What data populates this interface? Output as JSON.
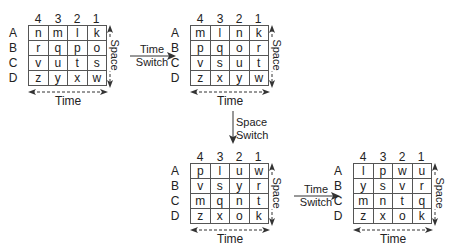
{
  "columns": [
    "4",
    "3",
    "2",
    "1"
  ],
  "rows": [
    "A",
    "B",
    "C",
    "D"
  ],
  "axis_labels": {
    "time": "Time",
    "space": "Space"
  },
  "grids": [
    {
      "id": "grid-1",
      "cells": [
        [
          "n",
          "m",
          "l",
          "k"
        ],
        [
          "r",
          "q",
          "p",
          "o"
        ],
        [
          "v",
          "u",
          "t",
          "s"
        ],
        [
          "z",
          "y",
          "x",
          "w"
        ]
      ]
    },
    {
      "id": "grid-2",
      "cells": [
        [
          "m",
          "l",
          "n",
          "k"
        ],
        [
          "p",
          "q",
          "o",
          "r"
        ],
        [
          "v",
          "s",
          "u",
          "t"
        ],
        [
          "z",
          "x",
          "y",
          "w"
        ]
      ]
    },
    {
      "id": "grid-3",
      "cells": [
        [
          "p",
          "l",
          "u",
          "w"
        ],
        [
          "v",
          "s",
          "y",
          "r"
        ],
        [
          "m",
          "q",
          "n",
          "t"
        ],
        [
          "z",
          "x",
          "o",
          "k"
        ]
      ]
    },
    {
      "id": "grid-4",
      "cells": [
        [
          "l",
          "p",
          "w",
          "u"
        ],
        [
          "y",
          "s",
          "v",
          "r"
        ],
        [
          "m",
          "n",
          "t",
          "q"
        ],
        [
          "z",
          "x",
          "o",
          "k"
        ]
      ]
    }
  ],
  "transitions": [
    {
      "line1": "Time",
      "line2": "Switch"
    },
    {
      "line1": "Space",
      "line2": "Switch"
    },
    {
      "line1": "Time",
      "line2": "Switch"
    }
  ]
}
